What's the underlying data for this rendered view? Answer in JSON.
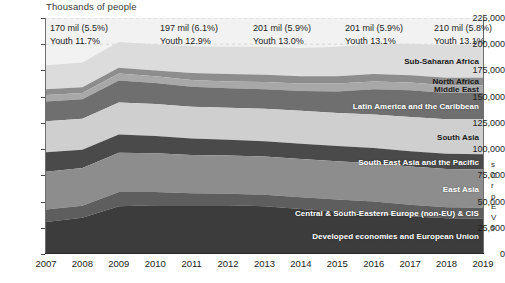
{
  "chart_data": {
    "type": "area",
    "title": "",
    "xlabel": "",
    "ylabel": "Thousands of people",
    "ylim": [
      0,
      225000
    ],
    "ytick_step": 25000,
    "grid": true,
    "legend_position": "inline-band-labels",
    "x": [
      2007,
      2008,
      2009,
      2010,
      2011,
      2012,
      2013,
      2014,
      2015,
      2016,
      2017,
      2018,
      2019
    ],
    "categories": [
      "2007",
      "2008",
      "2009",
      "2010",
      "2011",
      "2012",
      "2013",
      "2014",
      "2015",
      "2016",
      "2017",
      "2018",
      "2019"
    ],
    "series": [
      {
        "name": "Developed economies and European Union",
        "color": "#3c3c3c",
        "values": [
          30500,
          34500,
          45500,
          46500,
          46500,
          46500,
          45500,
          43000,
          40500,
          38500,
          36000,
          34000,
          33500
        ]
      },
      {
        "name": "Central & South-Eastern Europe (non-EU) & CIS",
        "color": "#5e5e5e",
        "values": [
          12000,
          11500,
          13500,
          12500,
          11500,
          11000,
          11000,
          11000,
          11500,
          11500,
          11000,
          10500,
          10500
        ]
      },
      {
        "name": "East Asia",
        "color": "#8d8d8d",
        "values": [
          36000,
          36000,
          37500,
          37000,
          36500,
          36500,
          36500,
          36500,
          36500,
          36500,
          36500,
          36500,
          36500
        ]
      },
      {
        "name": "South East Asia and the Pacific",
        "color": "#4a4a4a",
        "values": [
          18500,
          17500,
          17500,
          16500,
          15500,
          15000,
          14500,
          14500,
          14500,
          14500,
          14500,
          14500,
          14500
        ]
      },
      {
        "name": "South Asia",
        "color": "#cfcfcf",
        "values": [
          29500,
          29500,
          30500,
          30500,
          30500,
          30500,
          31000,
          31500,
          31500,
          32000,
          32500,
          33000,
          33500
        ]
      },
      {
        "name": "Latin America and the Caribbean",
        "color": "#6f6f6f",
        "values": [
          19000,
          18500,
          21000,
          20000,
          19000,
          18500,
          18500,
          19000,
          20500,
          24000,
          25500,
          25000,
          25000
        ]
      },
      {
        "name": "Middle East",
        "color": "#a8a8a8",
        "values": [
          6000,
          6000,
          6500,
          6500,
          6500,
          6500,
          7000,
          7000,
          7500,
          7500,
          7500,
          7500,
          7500
        ]
      },
      {
        "name": "North Africa",
        "color": "#8d8d8d",
        "values": [
          5500,
          5500,
          5500,
          5500,
          6500,
          7000,
          7000,
          7000,
          7000,
          7000,
          7000,
          7000,
          7000
        ]
      },
      {
        "name": "Sub-Saharan Africa",
        "color": "#dcdcdc",
        "values": [
          23000,
          23500,
          24500,
          25000,
          25500,
          26000,
          26500,
          27000,
          28000,
          29000,
          30000,
          31000,
          32000
        ]
      }
    ],
    "ytick_labels": [
      "0",
      "25,000",
      "50,000",
      "75,000",
      "100,000",
      "125,000",
      "150,000",
      "175,000",
      "200,000",
      "225,000"
    ],
    "ytick_values": [
      0,
      25000,
      50000,
      75000,
      100000,
      125000,
      150000,
      175000,
      200000,
      225000
    ],
    "annotations": [
      {
        "year": 2007,
        "total_label": "170 mil (5.5%)",
        "youth_label": "Youth 11.7%"
      },
      {
        "year": 2010,
        "total_label": "197 mil (6.1%)",
        "youth_label": "Youth 12.9%"
      },
      {
        "year": 2013,
        "total_label": "201 mil (5.9%)",
        "youth_label": "Youth 13.0%"
      },
      {
        "year": 2016,
        "total_label": "201 mil (5.9%)",
        "youth_label": "Youth 13.1%"
      },
      {
        "year": 2019,
        "total_label": "210 mil (5.8%)",
        "youth_label": "Youth 13.1%"
      }
    ],
    "band_labels": [
      {
        "name": "Sub-Saharan Africa",
        "dark": true
      },
      {
        "name": "North Africa",
        "dark": true
      },
      {
        "name": "Middle East",
        "dark": true
      },
      {
        "name": "Latin America and the Caribbean",
        "dark": false
      },
      {
        "name": "South Asia",
        "dark": true
      },
      {
        "name": "South East Asia and the Pacific",
        "dark": false
      },
      {
        "name": "East Asia",
        "dark": false
      },
      {
        "name": "Central & South-Eastern Europe (non-EU) & CIS",
        "dark": false
      },
      {
        "name": "Developed economies and European Union",
        "dark": false
      }
    ]
  },
  "axis": {
    "y_title": "Thousands of people"
  },
  "side_caption": {
    "lines": [
      "s",
      "C",
      "r",
      "p",
      "E",
      "V",
      "s"
    ]
  }
}
